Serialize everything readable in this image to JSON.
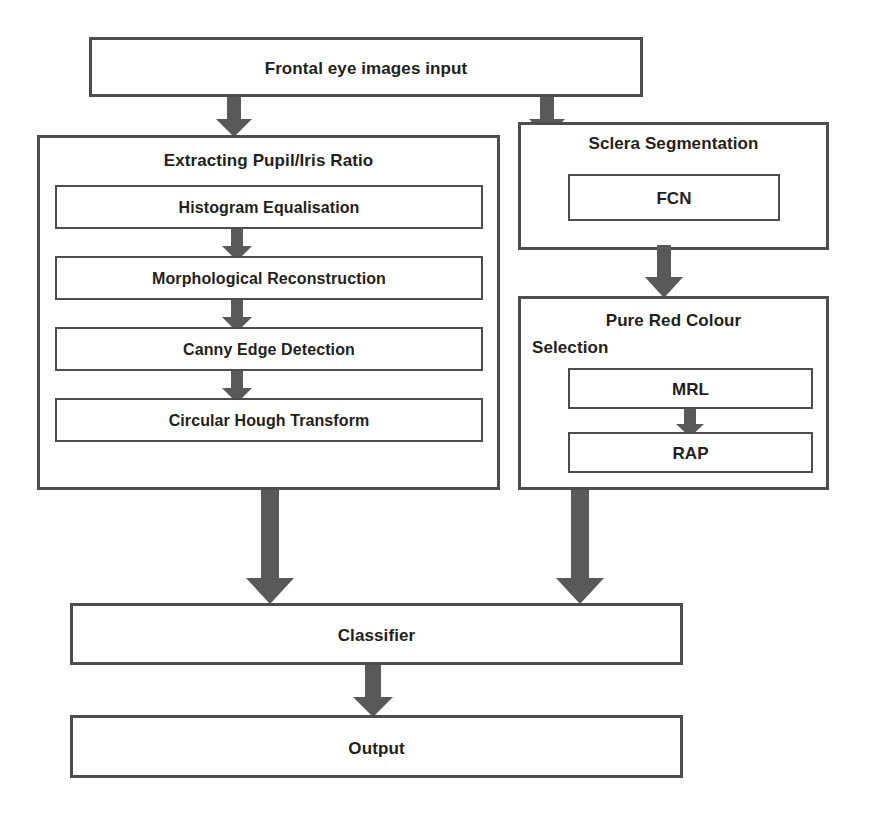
{
  "diagram": {
    "colors": {
      "box_stroke": "#4d4d4d",
      "arrow_fill": "#595959",
      "text": "#231f20",
      "background": "#ffffff"
    },
    "nodes": {
      "input": {
        "label": "Frontal eye images input"
      },
      "pupil_iris_group": {
        "label": "Extracting Pupil/Iris Ratio"
      },
      "histogram": {
        "label": "Histogram Equalisation"
      },
      "morphological": {
        "label": "Morphological Reconstruction"
      },
      "canny": {
        "label": "Canny Edge Detection"
      },
      "hough": {
        "label": "Circular Hough Transform"
      },
      "sclera_group": {
        "label": "Sclera Segmentation"
      },
      "fcn": {
        "label": "FCN"
      },
      "pure_red_group": {
        "label_line1": "Pure Red Colour",
        "label_line2": "Selection"
      },
      "mrl": {
        "label": "MRL"
      },
      "rap": {
        "label": "RAP"
      },
      "classifier": {
        "label": "Classifier"
      },
      "output": {
        "label": "Output"
      }
    },
    "edges": [
      {
        "from": "input",
        "to": "pupil_iris_group"
      },
      {
        "from": "input",
        "to": "sclera_group"
      },
      {
        "from": "histogram",
        "to": "morphological"
      },
      {
        "from": "morphological",
        "to": "canny"
      },
      {
        "from": "canny",
        "to": "hough"
      },
      {
        "from": "sclera_group",
        "to": "pure_red_group"
      },
      {
        "from": "mrl",
        "to": "rap"
      },
      {
        "from": "pupil_iris_group",
        "to": "classifier"
      },
      {
        "from": "pure_red_group",
        "to": "classifier"
      },
      {
        "from": "classifier",
        "to": "output"
      }
    ]
  }
}
